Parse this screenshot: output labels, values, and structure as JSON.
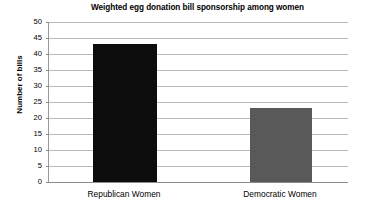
{
  "chart_data": {
    "type": "bar",
    "title": "Weighted egg donation bill sponsorship among women",
    "xlabel": "",
    "ylabel": "Number of bills",
    "categories": [
      "Republican Women",
      "Democratic Women"
    ],
    "values": [
      43,
      23
    ],
    "bar_colors": [
      "#0d0d0d",
      "#595959"
    ],
    "ylim": [
      0,
      50
    ],
    "ytick_step": 5,
    "yticks": [
      50,
      45,
      40,
      35,
      30,
      25,
      20,
      15,
      10,
      5,
      0
    ],
    "ytick_labels": [
      "50",
      "45",
      "40",
      "35",
      "30",
      "25",
      "20",
      "15",
      "10",
      "5",
      "0"
    ],
    "grid": "horizontal",
    "legend": "none",
    "gridline_color": "#b9b9b9",
    "axis_color": "#8d8d8d",
    "background": "#ffffff"
  }
}
